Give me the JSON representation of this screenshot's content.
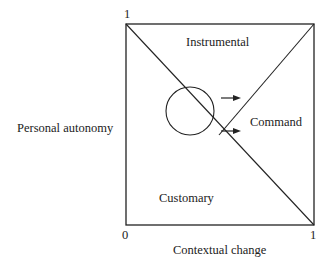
{
  "diagram": {
    "y_axis": {
      "label": "Personal autonomy",
      "max_tick": "1"
    },
    "x_axis": {
      "label": "Contextual change",
      "min_tick": "0",
      "max_tick": "1"
    },
    "regions": {
      "top": "Instrumental",
      "right": "Command",
      "bottom_left": "Customary"
    },
    "elements": {
      "circle": "circle",
      "arrows": [
        "arrow-right",
        "arrow-right"
      ]
    },
    "colors": {
      "line": "#222222",
      "background": "#ffffff"
    }
  }
}
